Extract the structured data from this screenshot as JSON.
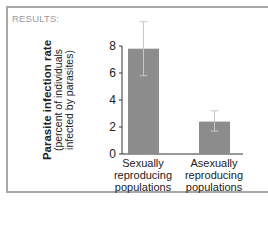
{
  "header": {
    "results_label": "RESULTS:"
  },
  "chart_data": {
    "type": "bar",
    "title": "",
    "xlabel": "",
    "ylabel": "Parasite infection rate",
    "ylabel_sub": [
      "(percent of individuals",
      "infected by parasites)"
    ],
    "categories": [
      "Sexually reproducing populations",
      "Asexually reproducing populations"
    ],
    "category_lines": [
      [
        "Sexually",
        "reproducing",
        "populations"
      ],
      [
        "Asexually",
        "reproducing",
        "populations"
      ]
    ],
    "values": [
      7.8,
      2.4
    ],
    "error_bars": [
      {
        "upper": 9.8,
        "lower": 5.8
      },
      {
        "upper": 3.2,
        "lower": 1.7
      }
    ],
    "yticks": [
      0,
      2,
      4,
      6,
      8
    ],
    "ylim": [
      0,
      8
    ],
    "grid": false,
    "bar_color": "#8c8c8c",
    "error_color": "#c8c8c8"
  }
}
